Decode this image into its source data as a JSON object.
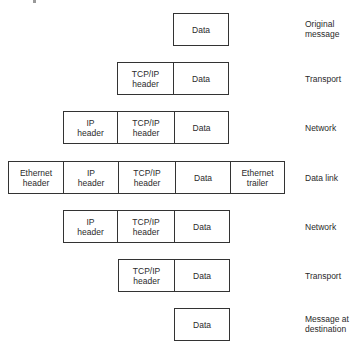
{
  "diagram": {
    "colors": {
      "border": "#333333",
      "text": "#2a2a2a",
      "background": "#ffffff"
    },
    "rows": [
      {
        "label": "Original\nmessage",
        "cells": [
          {
            "text": "Data"
          }
        ]
      },
      {
        "label": "Transport",
        "cells": [
          {
            "text": "TCP/IP\nheader"
          },
          {
            "text": "Data"
          }
        ]
      },
      {
        "label": "Network",
        "cells": [
          {
            "text": "IP\nheader"
          },
          {
            "text": "TCP/IP\nheader"
          },
          {
            "text": "Data"
          }
        ]
      },
      {
        "label": "Data link",
        "cells": [
          {
            "text": "Ethernet\nheader"
          },
          {
            "text": "IP\nheader"
          },
          {
            "text": "TCP/IP\nheader"
          },
          {
            "text": "Data"
          },
          {
            "text": "Ethernet\ntrailer"
          }
        ]
      },
      {
        "label": "Network",
        "cells": [
          {
            "text": "IP\nheader"
          },
          {
            "text": "TCP/IP\nheader"
          },
          {
            "text": "Data"
          }
        ]
      },
      {
        "label": "Transport",
        "cells": [
          {
            "text": "TCP/IP\nheader"
          },
          {
            "text": "Data"
          }
        ]
      },
      {
        "label": "Message at\ndestination",
        "cells": [
          {
            "text": "Data"
          }
        ]
      }
    ]
  }
}
